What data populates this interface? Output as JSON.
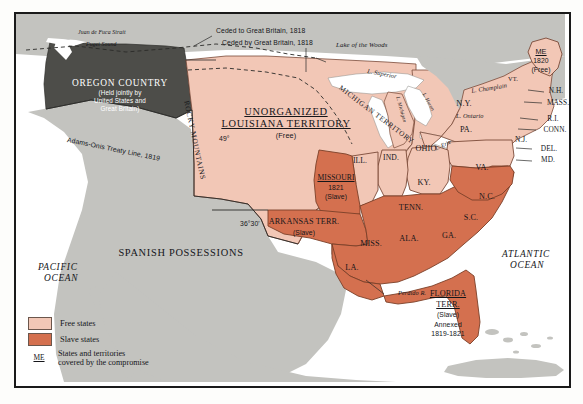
{
  "map": {
    "title": "Missouri Compromise Map",
    "colors": {
      "free_state": "#f2c7b6",
      "slave_state": "#d4704f",
      "foreign_gray": "#c3c3bf",
      "oregon_gray": "#4d4d49",
      "water": "#ffffff",
      "outline": "#7a4a38",
      "frame": "#1a1a1a",
      "ink": "#15161a"
    },
    "regions": {
      "oregon_name": "OREGON COUNTRY",
      "oregon_note_1": "(Held jointly by",
      "oregon_note_2": "United States and",
      "oregon_note_3": "Great Britain)",
      "louisiana_line1": "UNORGANIZED",
      "louisiana_line2": "LOUISIANA TERRITORY",
      "louisiana_status": "(Free)",
      "spanish": "SPANISH POSSESSIONS",
      "michigan_territory": "MICHIGAN TERRITORY"
    },
    "boundaries": {
      "ceded_to_gb": "Ceded to Great Britain, 1818",
      "ceded_by_gb": "Ceded by Great Britain, 1818",
      "adams_onis": "Adams-Onis Treaty Line, 1819",
      "lat_49": "49°",
      "lat_3630": "36°30'",
      "rocky_mountains": "ROCKY MOUNTAINS"
    },
    "water_labels": {
      "pacific_1": "PACIFIC",
      "pacific_2": "OCEAN",
      "atlantic_1": "ATLANTIC",
      "atlantic_2": "OCEAN",
      "juan_de_fuca": "Juan de Fuca Strait",
      "puget_sound": "Puget Sound",
      "lake_of_the_woods": "Lake of the Woods",
      "l_superior": "L. Superior",
      "l_michigan": "L. Michigan",
      "l_huron": "L. Huron",
      "l_erie": "L. Erie",
      "l_ontario": "L. Ontario",
      "l_champlain": "L. Champlain",
      "perdido_river": "Perdido R."
    },
    "compromise_states": [
      {
        "name": "MISSOURI",
        "year": "1821",
        "status": "(Slave)"
      },
      {
        "name": "ME",
        "year": "1820",
        "status": "(Free)"
      },
      {
        "name": "ARKANSAS TERR.",
        "year": "",
        "status": "(Slave)"
      },
      {
        "name": "FLORIDA",
        "name2": "TERR.",
        "status": "(Slave)",
        "note1": "Annexed",
        "note2": "1819-1821"
      }
    ],
    "state_labels": [
      "ILL.",
      "IND.",
      "OHIO",
      "PA.",
      "N.Y.",
      "VT.",
      "N.H.",
      "MASS.",
      "R.I.",
      "CONN.",
      "N.J.",
      "DEL.",
      "MD.",
      "VA.",
      "KY.",
      "TENN.",
      "N.C.",
      "S.C.",
      "GA.",
      "ALA.",
      "MISS.",
      "LA."
    ]
  },
  "legend": {
    "free_label": "Free states",
    "slave_label": "Slave states",
    "key_symbol": "ME",
    "key_line1": "States and territories",
    "key_line2": "covered by the compromise"
  }
}
